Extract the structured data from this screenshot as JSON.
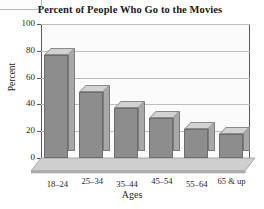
{
  "chart_data": {
    "type": "bar",
    "title": "Percent of People Who Go to the Movies",
    "xlabel": "Ages",
    "ylabel": "Percent",
    "categories": [
      "18–24",
      "25–34",
      "35–44",
      "45–54",
      "55–64",
      "65 & up"
    ],
    "values": [
      77,
      49,
      37,
      30,
      22,
      18
    ],
    "ylim": [
      0,
      100
    ],
    "yticks": [
      0,
      20,
      40,
      60,
      80,
      100
    ],
    "ytick_labels": [
      "0",
      "20",
      "40",
      "60",
      "80",
      "100"
    ],
    "grid": true,
    "legend": "none",
    "style": "3d-column",
    "colors": {
      "bar_front": "#8d8d8d",
      "bar_top": "#d2d2d2",
      "bar_side": "#a8a8a8",
      "plot_background": "#fbfbfb",
      "gridline": "#bdbdbd",
      "axis": "#5a5a5a",
      "text": "#1a1a1a",
      "floor": "#c9c9c9"
    }
  },
  "page": {
    "corner_tab": ""
  }
}
